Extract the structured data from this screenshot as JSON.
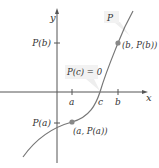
{
  "diagram": {
    "axes": {
      "x_label": "x",
      "y_label": "y",
      "x_ticks": [
        "a",
        "c",
        "b"
      ],
      "y_ticks": [
        "P(b)",
        "P(a)"
      ]
    },
    "curve": {
      "name": "P",
      "color": "#777777"
    },
    "points": [
      {
        "label": "(a, P(a))",
        "x": "a",
        "y": "P(a)"
      },
      {
        "label": "(b, P(b))",
        "x": "b",
        "y": "P(b)"
      }
    ],
    "callouts": {
      "curve_label": "P",
      "root_label": "P(c) = 0"
    },
    "colors": {
      "axis": "#555555",
      "curve": "#777777",
      "point": "#888888",
      "label_box": "#f2f2f2",
      "text": "#333333"
    }
  }
}
